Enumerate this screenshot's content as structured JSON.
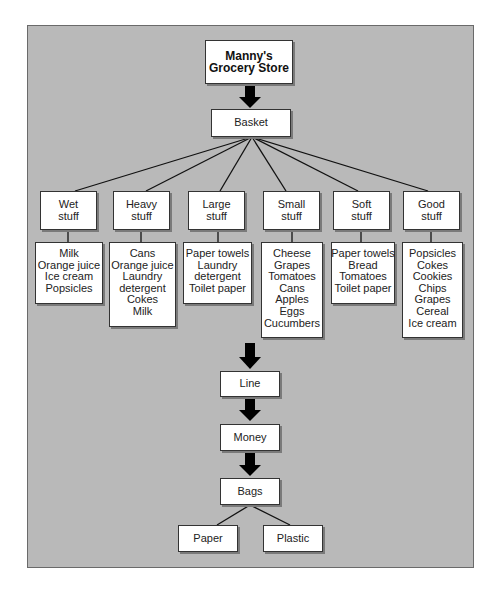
{
  "store": {
    "line1": "Manny's",
    "line2": "Grocery Store"
  },
  "basket": "Basket",
  "categories": [
    {
      "line1": "Wet",
      "line2": "stuff",
      "items": [
        "Milk",
        "Orange juice",
        "Ice cream",
        "Popsicles"
      ]
    },
    {
      "line1": "Heavy",
      "line2": "stuff",
      "items": [
        "Cans",
        "Orange juice",
        "Laundry",
        "detergent",
        "Cokes",
        "Milk"
      ]
    },
    {
      "line1": "Large",
      "line2": "stuff",
      "items": [
        "Paper towels",
        "Laundry",
        "detergent",
        "Toilet paper"
      ]
    },
    {
      "line1": "Small",
      "line2": "stuff",
      "items": [
        "Cheese",
        "Grapes",
        "Tomatoes",
        "Cans",
        "Apples",
        "Eggs",
        "Cucumbers"
      ]
    },
    {
      "line1": "Soft",
      "line2": "stuff",
      "items": [
        "Paper towels",
        "Bread",
        "Tomatoes",
        "Toilet paper"
      ]
    },
    {
      "line1": "Good",
      "line2": "stuff",
      "items": [
        "Popsicles",
        "Cokes",
        "Cookies",
        "Chips",
        "Grapes",
        "Cereal",
        "Ice cream"
      ]
    }
  ],
  "flow": {
    "line": "Line",
    "money": "Money",
    "bags": "Bags"
  },
  "bag_types": [
    "Paper",
    "Plastic"
  ],
  "colors": {
    "frame": "#b9b9b9",
    "box": "#ffffff",
    "arrow": "#000000"
  }
}
